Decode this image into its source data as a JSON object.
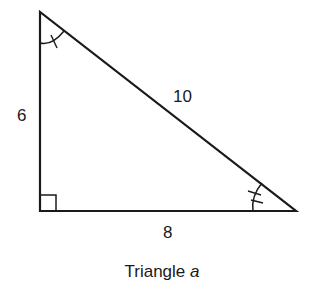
{
  "diagram": {
    "type": "right-triangle",
    "stroke_color": "#1a1a1a",
    "background": "#ffffff",
    "vertices": {
      "top": [
        40,
        12
      ],
      "right_angle": [
        40,
        211
      ],
      "right": [
        296,
        211
      ]
    },
    "sides": {
      "vertical_leg": {
        "label": "6"
      },
      "hypotenuse": {
        "label": "10"
      },
      "horizontal_leg": {
        "label": "8"
      }
    },
    "angle_marks": {
      "top": "single-tick-arc",
      "right_angle": "square",
      "right": "double-tick-arc"
    },
    "caption": {
      "prefix": "Triangle ",
      "variable": "a"
    }
  }
}
